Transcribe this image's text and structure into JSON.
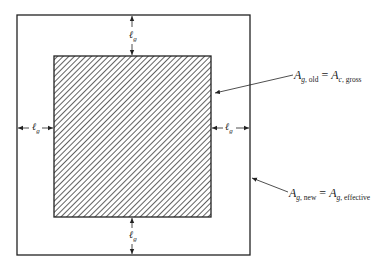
{
  "diagram": {
    "type": "grout/gusset area schematic",
    "colors": {
      "line": "#222222",
      "hatch": "#3a3a3a",
      "background": "#ffffff"
    },
    "outer_box": {
      "x": 17,
      "y": 15,
      "w": 233,
      "h": 240
    },
    "inner_box": {
      "x": 54,
      "y": 56,
      "w": 157,
      "h": 161,
      "fill": "diagonal-hatch"
    },
    "dimensions": {
      "top": {
        "symbol": "ℓ",
        "subscript": "g"
      },
      "bottom": {
        "symbol": "ℓ",
        "subscript": "g"
      },
      "left": {
        "symbol": "ℓ",
        "subscript": "g"
      },
      "right": {
        "symbol": "ℓ",
        "subscript": "g"
      }
    },
    "labels": {
      "old": {
        "lhs_main": "A",
        "lhs_sub_italic": "g",
        "lhs_sub": ", old",
        "equals": " = ",
        "rhs_main": "A",
        "rhs_sub_italic": "c",
        "rhs_sub": ", gross",
        "points_to": "inner_box"
      },
      "new": {
        "lhs_main": "A",
        "lhs_sub_italic": "g",
        "lhs_sub": ", new",
        "equals": " = ",
        "rhs_main": "A",
        "rhs_sub_italic": "g",
        "rhs_sub": ", effective",
        "points_to": "outer_box"
      }
    }
  }
}
